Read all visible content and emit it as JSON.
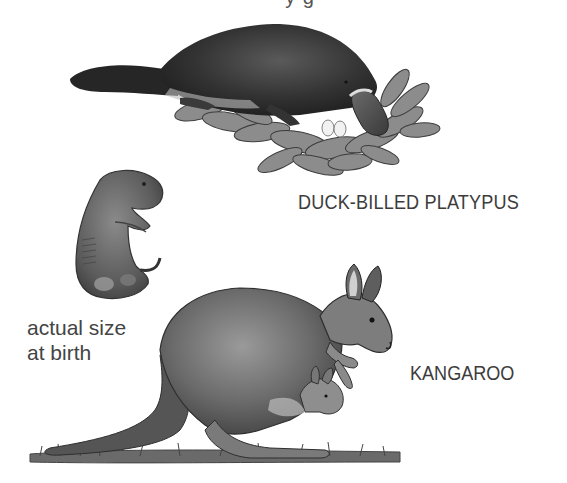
{
  "figure": {
    "cut_off_heading": "y g",
    "labels": {
      "platypus": "DUCK-BILLED PLATYPUS",
      "kangaroo": "KANGAROO",
      "joey_size_line1": "actual size",
      "joey_size_line2": "at birth"
    },
    "illustrations": [
      {
        "name": "platypus-on-nest",
        "description": "Duck-billed platypus lying on a nest of leaves with two white eggs"
      },
      {
        "name": "newborn-joey",
        "description": "Newborn kangaroo joey shown at actual size"
      },
      {
        "name": "kangaroo-with-joey",
        "description": "Adult kangaroo with a joey peeking from its pouch, standing on grass"
      }
    ],
    "colors": {
      "background": "#ffffff",
      "text": "#3c3c3c",
      "fur_dark": "#2b2b2b",
      "fur_mid": "#6b6b6b",
      "leaf": "#8a8a8a",
      "egg": "#f2f2f2"
    }
  }
}
